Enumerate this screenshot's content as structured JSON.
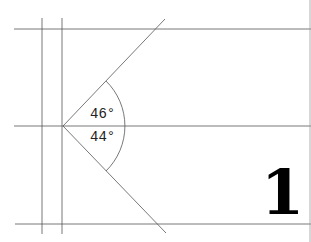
{
  "diagram": {
    "angles": [
      {
        "label": "46°",
        "value": 46
      },
      {
        "label": "44°",
        "value": 44
      }
    ],
    "page_number": "1",
    "colors": {
      "line": "#555555",
      "text": "#222222",
      "numeral": "#000000",
      "background": "#ffffff"
    }
  }
}
